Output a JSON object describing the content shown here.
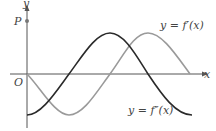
{
  "diagram": {
    "axes": {
      "x_label": "x",
      "y_label": "y",
      "origin_label": "O",
      "point_label": "P"
    },
    "curves": [
      {
        "name": "f-prime",
        "label": "y = f′(x)",
        "color": "#9a9a9a",
        "shape": "-sin(x)"
      },
      {
        "name": "f-double-prime",
        "label": "y = f″(x)",
        "color": "#2a2a2a",
        "shape": "-cos(x)"
      }
    ],
    "colors": {
      "axis": "#555555",
      "point": "#777777"
    }
  }
}
